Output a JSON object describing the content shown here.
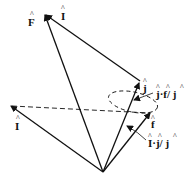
{
  "diagram": {
    "type": "vector-diagram",
    "colors": {
      "stroke": "#111111",
      "background": "#ffffff"
    },
    "labels": {
      "F": "F",
      "I_top": "I",
      "I_left": "I",
      "j": "j",
      "f": "f",
      "j_dot_f": "j·f/ j",
      "I_dot_j": "I·j/ j"
    },
    "hat": "^"
  }
}
